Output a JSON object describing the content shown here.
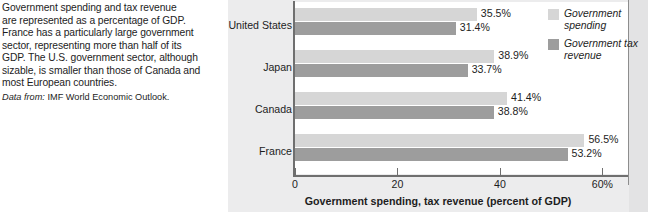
{
  "caption": {
    "lines": [
      "Government spending and tax revenue",
      "are represented as a percentage of GDP.",
      "France has a particularly large government",
      "sector, representing more than half of its",
      "GDP. The U.S. government sector, although",
      "sizable, is smaller than those of Canada and",
      "most European countries."
    ],
    "source_label": "Data from:",
    "source_text": "IMF World Economic Outlook."
  },
  "chart_data": {
    "type": "bar",
    "orientation": "horizontal",
    "title": "",
    "xlabel": "Government spending, tax revenue (percent of GDP)",
    "ylabel": "",
    "xlim": [
      0,
      65
    ],
    "xticks": [
      0,
      20,
      40,
      60
    ],
    "xtick_labels": [
      "0",
      "20",
      "40",
      "60%"
    ],
    "grid": false,
    "legend_position": "top-right",
    "categories": [
      "United States",
      "Japan",
      "Canada",
      "France"
    ],
    "series": [
      {
        "name": "Government spending",
        "color": "#d6d6d6",
        "values": [
          35.5,
          38.9,
          41.4,
          56.5
        ],
        "value_labels": [
          "35.5%",
          "38.9%",
          "41.4%",
          "56.5%"
        ]
      },
      {
        "name": "Government tax revenue",
        "color": "#9d9d9d",
        "values": [
          31.4,
          33.7,
          38.8,
          53.2
        ],
        "value_labels": [
          "31.4%",
          "33.7%",
          "38.8%",
          "53.2%"
        ]
      }
    ]
  },
  "legend": {
    "items": [
      {
        "label": "Government spending",
        "color": "#d6d6d6"
      },
      {
        "label": "Government tax revenue",
        "color": "#9d9d9d"
      }
    ]
  }
}
